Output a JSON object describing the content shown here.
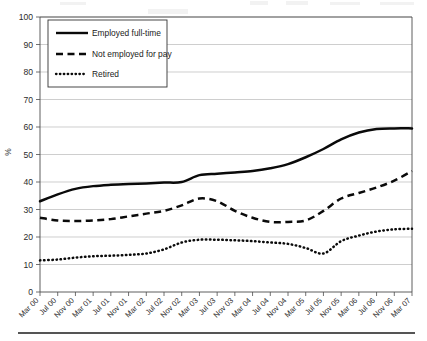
{
  "chart_data": {
    "type": "line",
    "title": "",
    "xlabel": "",
    "ylabel": "%",
    "ylim": [
      0,
      100
    ],
    "ytick_step": 10,
    "yticks": [
      0,
      10,
      20,
      30,
      40,
      50,
      60,
      70,
      80,
      90,
      100
    ],
    "grid": true,
    "legend_position": "top-left inside plot",
    "categories": [
      "Mar 00",
      "Jul 00",
      "Nov 00",
      "Mar 01",
      "Jul 01",
      "Nov 01",
      "Mar 02",
      "Jul 02",
      "Nov 02",
      "Mar 03",
      "Jul 03",
      "Nov 03",
      "Mar 04",
      "Jul 04",
      "Nov 04",
      "Mar 05",
      "Jul 05",
      "Nov 05",
      "Mar 06",
      "Jul 06",
      "Nov 06",
      "Mar 07"
    ],
    "series": [
      {
        "name": "Employed full-time",
        "style": "solid",
        "color": "#0a0a0a",
        "values": [
          33,
          35.5,
          37.5,
          38.5,
          39,
          39.3,
          39.5,
          39.8,
          40,
          42.5,
          43,
          43.5,
          44,
          45,
          46.5,
          49,
          52,
          55.5,
          58,
          59.3,
          59.5,
          59.5
        ]
      },
      {
        "name": "Not employed for pay",
        "style": "dashed",
        "color": "#0a0a0a",
        "values": [
          27,
          26,
          25.8,
          26,
          26.5,
          27.5,
          28.5,
          29.5,
          31.5,
          34,
          33,
          29.5,
          27,
          25.5,
          25.5,
          26,
          29.5,
          34,
          36,
          38,
          40.5,
          44
        ]
      },
      {
        "name": "Retired",
        "style": "dotted",
        "color": "#0a0a0a",
        "values": [
          11.5,
          11.8,
          12.5,
          13,
          13.2,
          13.5,
          14,
          15.5,
          18,
          19,
          19,
          18.8,
          18.5,
          18,
          17.5,
          16,
          14,
          18.5,
          20.5,
          22,
          22.8,
          23
        ]
      }
    ]
  },
  "legend": {
    "entries": [
      {
        "label": "Employed full-time"
      },
      {
        "label": "Not employed for pay"
      },
      {
        "label": "Retired"
      }
    ]
  },
  "axes": {
    "y_title": "%"
  }
}
